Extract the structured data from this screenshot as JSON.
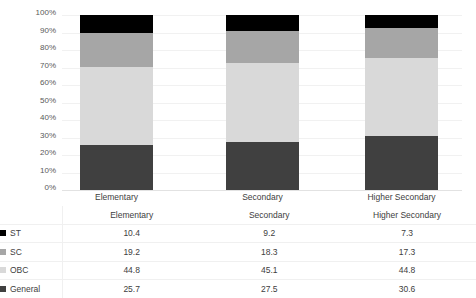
{
  "chart_data": {
    "type": "bar",
    "subtype": "100% stacked column with data table",
    "title": "",
    "xlabel": "",
    "ylabel": "",
    "ylim": [
      0,
      100
    ],
    "ytick_labels": [
      "100%",
      "90%",
      "80%",
      "70%",
      "60%",
      "50%",
      "40%",
      "30%",
      "20%",
      "10%",
      "0%"
    ],
    "grid": true,
    "legend_position": "data-table-left",
    "categories": [
      "Elementary",
      "Secondary",
      "Higher Secondary"
    ],
    "stack_order_bottom_to_top": [
      "General",
      "OBC",
      "SC",
      "ST"
    ],
    "series": [
      {
        "name": "ST",
        "color": "#000000",
        "values": [
          10.4,
          9.2,
          7.3
        ]
      },
      {
        "name": "SC",
        "color": "#a6a6a6",
        "values": [
          19.2,
          18.3,
          17.3
        ]
      },
      {
        "name": "OBC",
        "color": "#d9d9d9",
        "values": [
          44.8,
          45.1,
          44.8
        ]
      },
      {
        "name": "General",
        "color": "#404040",
        "values": [
          25.7,
          27.5,
          30.6
        ]
      }
    ]
  },
  "table": {
    "header": [
      "",
      "Elementary",
      "Secondary",
      "Higher Secondary"
    ],
    "rows": [
      {
        "label": "ST",
        "swatch": "#000000",
        "values": [
          "10.4",
          "9.2",
          "7.3"
        ]
      },
      {
        "label": "SC",
        "swatch": "#a6a6a6",
        "values": [
          "19.2",
          "18.3",
          "17.3"
        ]
      },
      {
        "label": "OBC",
        "swatch": "#d9d9d9",
        "values": [
          "44.8",
          "45.1",
          "44.8"
        ]
      },
      {
        "label": "General",
        "swatch": "#404040",
        "values": [
          "25.7",
          "27.5",
          "30.6"
        ]
      }
    ]
  },
  "axis": {
    "y_ticks": [
      "100%",
      "90%",
      "80%",
      "70%",
      "60%",
      "50%",
      "40%",
      "30%",
      "20%",
      "10%",
      "0%"
    ],
    "x_labels": [
      "Elementary",
      "Secondary",
      "Higher Secondary"
    ]
  },
  "colors": {
    "st": "#000000",
    "sc": "#a6a6a6",
    "obc": "#d9d9d9",
    "general": "#404040",
    "gridline": "#f1f1f1",
    "axis_text": "#595959"
  }
}
